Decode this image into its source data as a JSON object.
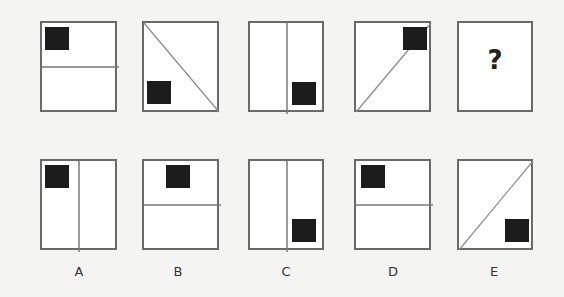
{
  "puzzle": {
    "sequence": [
      {
        "id": "seq-1",
        "divider": "horizontal",
        "square": "top-left"
      },
      {
        "id": "seq-2",
        "divider": "diagonal-tl-br",
        "square": "bottom-left"
      },
      {
        "id": "seq-3",
        "divider": "vertical",
        "square": "bottom-right"
      },
      {
        "id": "seq-4",
        "divider": "diagonal-bl-tr",
        "square": "top-right"
      },
      {
        "id": "seq-5",
        "divider": "none",
        "square": "none",
        "text": "?"
      }
    ],
    "options": [
      {
        "label": "A",
        "divider": "vertical",
        "square": "top-left"
      },
      {
        "label": "B",
        "divider": "horizontal",
        "square": "top-center"
      },
      {
        "label": "C",
        "divider": "vertical",
        "square": "bottom-right"
      },
      {
        "label": "D",
        "divider": "horizontal",
        "square": "top-left"
      },
      {
        "label": "E",
        "divider": "diagonal-bl-tr",
        "square": "bottom-right"
      }
    ]
  },
  "colors": {
    "square": "#1c1c1c",
    "border": "#6a6a6a",
    "background": "#f4f4f2"
  }
}
